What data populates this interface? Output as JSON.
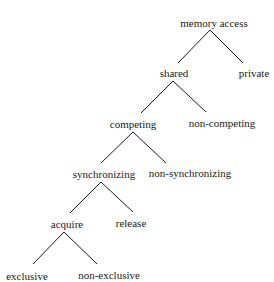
{
  "diagram": {
    "type": "tree",
    "colors": {
      "line": "#1a1a1a",
      "text": "#1a1a1a",
      "background": "#ffffff"
    },
    "nodes": [
      {
        "id": "memory_access",
        "label": "memory access",
        "x": 214,
        "y": 23
      },
      {
        "id": "shared",
        "label": "shared",
        "x": 174,
        "y": 73
      },
      {
        "id": "private",
        "label": "private",
        "x": 254,
        "y": 73
      },
      {
        "id": "competing",
        "label": "competing",
        "x": 133,
        "y": 124
      },
      {
        "id": "non_competing",
        "label": "non-competing",
        "x": 222,
        "y": 123
      },
      {
        "id": "synchronizing",
        "label": "synchronizing",
        "x": 104,
        "y": 174
      },
      {
        "id": "non_synchronizing",
        "label": "non-synchronizing",
        "x": 190,
        "y": 173
      },
      {
        "id": "acquire",
        "label": "acquire",
        "x": 67,
        "y": 224
      },
      {
        "id": "release",
        "label": "release",
        "x": 131,
        "y": 223
      },
      {
        "id": "exclusive",
        "label": "exclusive",
        "x": 27,
        "y": 276
      },
      {
        "id": "non_exclusive",
        "label": "non-exclusive",
        "x": 109,
        "y": 275
      }
    ],
    "edges": [
      {
        "from": "memory_access",
        "to": "shared",
        "x1": 210,
        "y1": 30,
        "x2": 178,
        "y2": 63
      },
      {
        "from": "memory_access",
        "to": "private",
        "x1": 210,
        "y1": 30,
        "x2": 243,
        "y2": 63
      },
      {
        "from": "shared",
        "to": "competing",
        "x1": 173,
        "y1": 81,
        "x2": 141,
        "y2": 113
      },
      {
        "from": "shared",
        "to": "non_competing",
        "x1": 173,
        "y1": 81,
        "x2": 206,
        "y2": 112
      },
      {
        "from": "competing",
        "to": "synchronizing",
        "x1": 133,
        "y1": 132,
        "x2": 101,
        "y2": 163
      },
      {
        "from": "competing",
        "to": "non_synchronizing",
        "x1": 133,
        "y1": 132,
        "x2": 166,
        "y2": 163
      },
      {
        "from": "synchronizing",
        "to": "acquire",
        "x1": 101,
        "y1": 182,
        "x2": 70,
        "y2": 213
      },
      {
        "from": "synchronizing",
        "to": "release",
        "x1": 101,
        "y1": 182,
        "x2": 133,
        "y2": 212
      },
      {
        "from": "acquire",
        "to": "exclusive",
        "x1": 64,
        "y1": 232,
        "x2": 33,
        "y2": 264
      },
      {
        "from": "acquire",
        "to": "non_exclusive",
        "x1": 64,
        "y1": 232,
        "x2": 97,
        "y2": 264
      }
    ]
  }
}
